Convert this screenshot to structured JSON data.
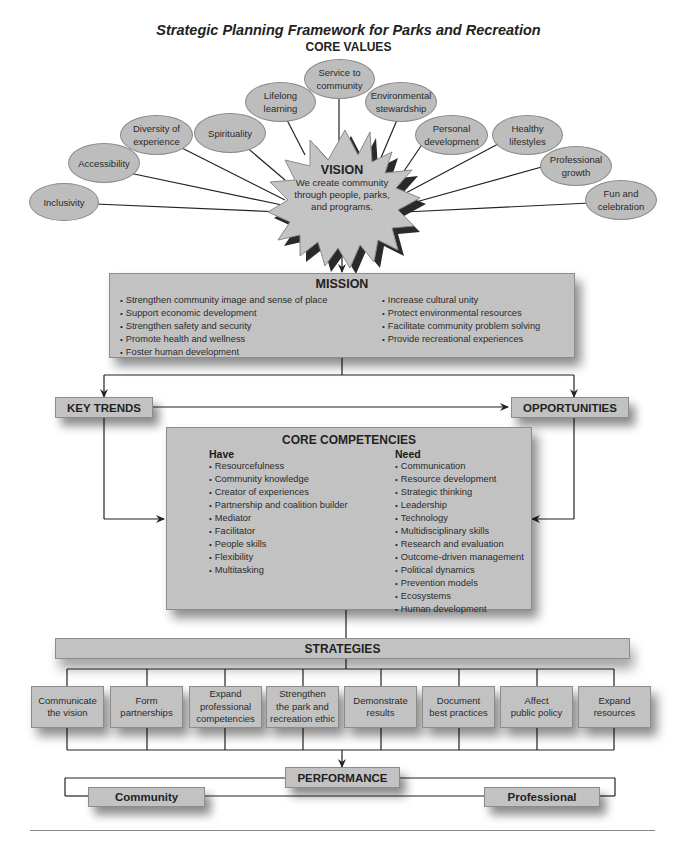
{
  "title": "Strategic Planning Framework for Parks and Recreation",
  "core_values": {
    "heading": "CORE VALUES",
    "items": [
      {
        "label": "Inclusivity"
      },
      {
        "label": "Accessibility"
      },
      {
        "label": "Diversity of experience"
      },
      {
        "label": "Spirituality"
      },
      {
        "label": "Lifelong learning"
      },
      {
        "label": "Service to community"
      },
      {
        "label": "Environmental stewardship"
      },
      {
        "label": "Personal development"
      },
      {
        "label": "Healthy lifestyles"
      },
      {
        "label": "Professional growth"
      },
      {
        "label": "Fun and celebration"
      }
    ]
  },
  "vision": {
    "heading": "VISION",
    "text_line1": "We create community",
    "text_line2": "through people, parks,",
    "text_line3": "and programs."
  },
  "mission": {
    "heading": "MISSION",
    "left": [
      "Strengthen community image and sense of place",
      "Support economic development",
      "Strengthen safety and security",
      "Promote health and wellness",
      "Foster human development"
    ],
    "right": [
      "Increase cultural unity",
      "Protect environmental resources",
      "Facilitate community problem solving",
      "Provide recreational experiences"
    ]
  },
  "key_trends": {
    "label": "KEY TRENDS"
  },
  "opportunities": {
    "label": "OPPORTUNITIES"
  },
  "core_competencies": {
    "heading": "CORE COMPETENCIES",
    "have": {
      "heading": "Have",
      "items": [
        "Resourcefulness",
        "Community knowledge",
        "Creator of experiences",
        "Partnership and coalition builder",
        "Mediator",
        "Facilitator",
        "People skills",
        "Flexibility",
        "Multitasking"
      ]
    },
    "need": {
      "heading": "Need",
      "items": [
        "Communication",
        "Resource development",
        "Strategic thinking",
        "Leadership",
        "Technology",
        "Multidisciplinary skills",
        "Research and evaluation",
        "Outcome-driven management",
        "Political dynamics",
        "Prevention models",
        "Ecosystems",
        "Human development"
      ]
    }
  },
  "strategies": {
    "heading": "STRATEGIES",
    "items": [
      {
        "line1": "Communicate",
        "line2": "the vision",
        "line3": ""
      },
      {
        "line1": "Form",
        "line2": "partnerships",
        "line3": ""
      },
      {
        "line1": "Expand",
        "line2": "professional",
        "line3": "competencies"
      },
      {
        "line1": "Strengthen",
        "line2": "the park and",
        "line3": "recreation ethic"
      },
      {
        "line1": "Demonstrate",
        "line2": "results",
        "line3": ""
      },
      {
        "line1": "Document",
        "line2": "best practices",
        "line3": ""
      },
      {
        "line1": "Affect",
        "line2": "public policy",
        "line3": ""
      },
      {
        "line1": "Expand",
        "line2": "resources",
        "line3": ""
      }
    ]
  },
  "performance": {
    "heading": "PERFORMANCE",
    "community": "Community",
    "professional": "Professional"
  },
  "colors": {
    "box_fill": "#c2c2c2",
    "oval_fill": "#bdbdbd",
    "line": "#222222"
  }
}
